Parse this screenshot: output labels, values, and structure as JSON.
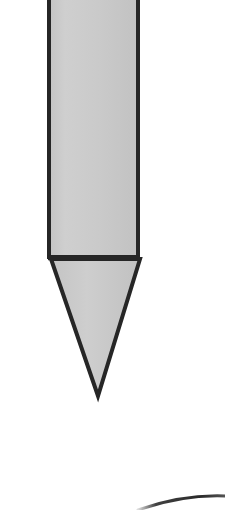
{
  "figure": {
    "title": "",
    "background_color": "#ffffff",
    "width": 225,
    "height": 510,
    "caption": ""
  },
  "palette": {
    "outline": "#262626",
    "fill": "#c8c8c8",
    "fill_highlight": "#d2d2d2",
    "background": "#ffffff",
    "arc_stroke": "#1f1f1f"
  },
  "shapes": {
    "shaft": {
      "label": "shaft",
      "kind": "rectangle",
      "fill": "#c8c8c8",
      "stroke": "#262626",
      "stroke_width": 4,
      "left": 49,
      "right": 138,
      "top": -6,
      "bottom": 257
    },
    "tip": {
      "label": "tip",
      "kind": "triangle",
      "fill": "#c8c8c8",
      "stroke": "#262626",
      "stroke_width": 4,
      "apex_x": 98,
      "apex_y": 396,
      "base_left_x": 51,
      "base_right_x": 140,
      "base_y": 259
    },
    "divider": {
      "label": "divider",
      "kind": "line",
      "stroke": "#262626",
      "stroke_width": 4,
      "x1": 49,
      "x2": 139,
      "y": 258
    },
    "arc": {
      "label": "arc",
      "kind": "arc",
      "stroke": "#1f1f1f",
      "stroke_width": 3,
      "start_x": 138,
      "start_y": 509,
      "end_x": 227,
      "end_y": 496,
      "control_x": 183,
      "control_y": 494
    }
  }
}
